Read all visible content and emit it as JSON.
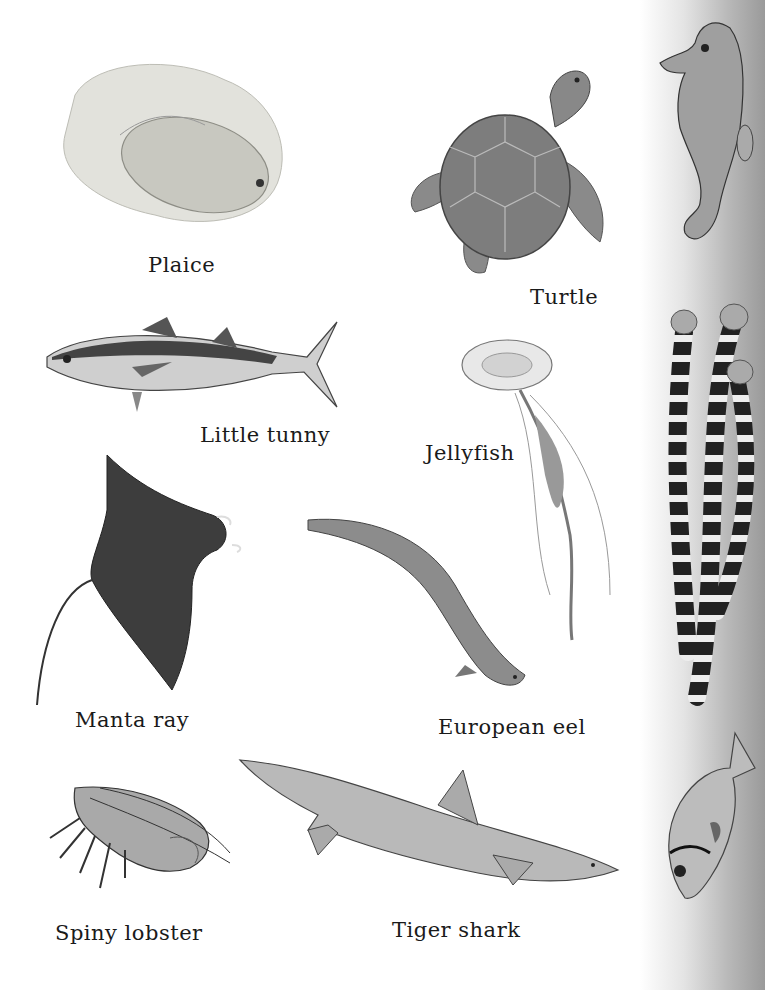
{
  "page": {
    "background": "#ffffff",
    "strip_colors": [
      "#ffffff",
      "#9a9a9a"
    ]
  },
  "creatures": [
    {
      "id": "plaice",
      "label": "Plaice"
    },
    {
      "id": "turtle",
      "label": "Turtle"
    },
    {
      "id": "little-tunny",
      "label": "Little tunny"
    },
    {
      "id": "jellyfish",
      "label": "Jellyfish"
    },
    {
      "id": "manta-ray",
      "label": "Manta ray"
    },
    {
      "id": "european-eel",
      "label": "European eel"
    },
    {
      "id": "spiny-lobster",
      "label": "Spiny lobster"
    },
    {
      "id": "tiger-shark",
      "label": "Tiger shark"
    }
  ],
  "side_strip": [
    {
      "id": "seahorse",
      "label": ""
    },
    {
      "id": "striped-pipefish",
      "label": ""
    },
    {
      "id": "reef-fish",
      "label": ""
    }
  ]
}
